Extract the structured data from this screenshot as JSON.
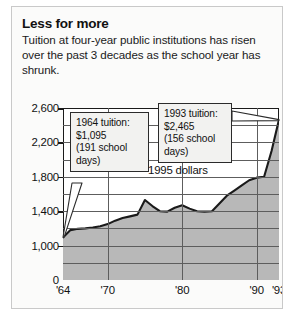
{
  "headline": "Less for more",
  "subhead": "Tuition at four-year public institutions has risen over the past 3 decades as the school year has shrunk.",
  "annotations": {
    "left": {
      "line1": "1964 tuition:",
      "line2": "$1,095",
      "line3": "(191 school",
      "line4": "days)"
    },
    "right": {
      "line1": "1993 tuition:",
      "line2": "$2,465",
      "line3": "(156 school",
      "line4": "days)"
    },
    "units_note": "1995 dollars"
  },
  "colors": {
    "area_fill": "#b8b8b8",
    "series_line": "#1a1a1a",
    "grid": "#5d5d5d",
    "frame": "#1a1a1a",
    "callout_bg": "#f2f2f0",
    "panel_bg": "#fbfbfa"
  },
  "chart_data": {
    "type": "area",
    "title": "Less for more",
    "subtitle": "Tuition at four-year public institutions has risen over the past 3 decades as the school year has shrunk.",
    "xlabel": "",
    "ylabel": "",
    "annotation_note": "1995 dollars",
    "grid": true,
    "legend": "none",
    "xlim": [
      1964,
      1993
    ],
    "ylim": [
      0,
      2600
    ],
    "y_axis_break": true,
    "y_axis_break_note": "Axis jumps from 0 to 1,000; above 1,000 the scale is linear in 400-dollar steps",
    "ytick_labels": [
      "2,600",
      "2,200",
      "1,800",
      "1,400",
      "1,000",
      "0"
    ],
    "ytick_values": [
      2600,
      2200,
      1800,
      1400,
      1000,
      0
    ],
    "xtick_labels": [
      "'64",
      "'70",
      "'80",
      "'90",
      "'93"
    ],
    "xtick_values": [
      1964,
      1970,
      1980,
      1990,
      1993
    ],
    "series": [
      {
        "name": "Tuition at four-year public institutions (1995 dollars)",
        "x": [
          1964,
          1965,
          1966,
          1967,
          1968,
          1969,
          1970,
          1971,
          1972,
          1973,
          1974,
          1975,
          1976,
          1977,
          1978,
          1979,
          1980,
          1981,
          1982,
          1983,
          1984,
          1985,
          1986,
          1987,
          1988,
          1989,
          1990,
          1991,
          1992,
          1993
        ],
        "values": [
          1095,
          1180,
          1195,
          1200,
          1210,
          1225,
          1250,
          1290,
          1320,
          1340,
          1360,
          1530,
          1460,
          1400,
          1395,
          1440,
          1470,
          1430,
          1400,
          1395,
          1400,
          1490,
          1580,
          1640,
          1700,
          1760,
          1790,
          1800,
          2100,
          2465
        ]
      }
    ],
    "callouts": [
      {
        "id": "1964-tuition",
        "year": 1964,
        "value": 1095,
        "text": "1964 tuition: $1,095 (191 school days)",
        "school_days": 191
      },
      {
        "id": "1993-tuition",
        "year": 1993,
        "value": 2465,
        "text": "1993 tuition: $2,465 (156 school days)",
        "school_days": 156
      }
    ]
  }
}
